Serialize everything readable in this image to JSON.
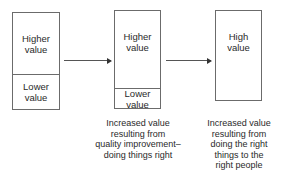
{
  "diagram": {
    "boxes": [
      {
        "id": "initial",
        "segments": [
          {
            "label_lines": [
              "Higher",
              "value"
            ]
          },
          {
            "label_lines": [
              "Lower",
              "value"
            ]
          }
        ]
      },
      {
        "id": "after-quality-improvement",
        "segments": [
          {
            "label_lines": [
              "Higher",
              "value"
            ]
          },
          {
            "label_lines": [
              "Lower",
              "value"
            ]
          }
        ],
        "caption_lines": [
          "Increased value",
          "resulting from",
          "quality improvement–",
          "doing things right"
        ]
      },
      {
        "id": "after-doing-right-things",
        "segments": [
          {
            "label_lines": [
              "High",
              "value"
            ]
          }
        ],
        "caption_lines": [
          "Increased value",
          "resulting from",
          "doing the right",
          "things to the",
          "right people"
        ]
      }
    ],
    "arrows": [
      {
        "from": "initial",
        "to": "after-quality-improvement"
      },
      {
        "from": "after-quality-improvement",
        "to": "after-doing-right-things"
      }
    ],
    "colors": {
      "stroke": "#6b6b6b",
      "text": "#2a2a2a",
      "background": "#ffffff"
    }
  }
}
